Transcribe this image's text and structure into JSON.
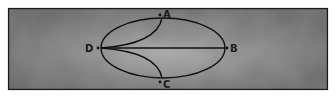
{
  "diagram": {
    "type": "geometric-figure",
    "background": {
      "color": "#8a8a8a",
      "border_color": "#1a1a1a"
    },
    "ellipse": {
      "cx": 163,
      "cy": 48,
      "rx": 62,
      "ry": 30
    },
    "points": [
      {
        "id": "A",
        "label": "A",
        "x": 161,
        "y": 15
      },
      {
        "id": "B",
        "label": "B",
        "x": 228,
        "y": 48
      },
      {
        "id": "C",
        "label": "C",
        "x": 161,
        "y": 82
      },
      {
        "id": "D",
        "label": "D",
        "x": 98,
        "y": 48
      }
    ],
    "edges": [
      {
        "from": "D",
        "to": "B",
        "kind": "straight"
      },
      {
        "from": "D",
        "to": "A",
        "kind": "curve"
      },
      {
        "from": "D",
        "to": "C",
        "kind": "curve"
      }
    ]
  }
}
